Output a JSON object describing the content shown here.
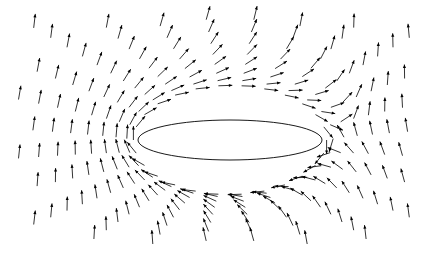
{
  "chart_data": {
    "type": "quiver",
    "title": "",
    "xlabel": "",
    "ylabel": "",
    "axes_visible": false,
    "grid": false,
    "legend": null,
    "background": "#ffffff",
    "arrow_color": "#000000",
    "center": {
      "x": 230,
      "y": 140
    },
    "ellipse": {
      "rx": 92,
      "ry": 20
    },
    "spoke_count": 26,
    "arrows_per_spoke": 14,
    "arrow_length_px": 14,
    "extent": {
      "xmin": 18,
      "xmax": 420,
      "ymin": 18,
      "ymax": 245
    }
  }
}
